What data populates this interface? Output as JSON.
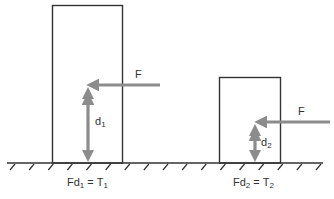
{
  "diagram": {
    "colors": {
      "outline": "#333333",
      "arrow": "#8c8c8c",
      "text": "#333333",
      "background": "#ffffff"
    },
    "ground": {
      "y": 163,
      "x_start": 7,
      "x_end": 323,
      "hatch_count": 17
    },
    "objects": [
      {
        "id": "tall-block",
        "box": {
          "x": 52,
          "y": 5,
          "w": 71,
          "h": 158
        },
        "force": {
          "label": "F",
          "from_x": 160,
          "to_x": 87,
          "y": 85
        },
        "moment_arm": {
          "label": "d",
          "subscript": "1",
          "x": 88,
          "y_top": 87,
          "y_bottom": 162
        },
        "equation": {
          "lhs_main": "Fd",
          "lhs_sub": "1",
          "eq": " = ",
          "rhs_main": "T",
          "rhs_sub": "1"
        }
      },
      {
        "id": "short-block",
        "box": {
          "x": 219,
          "y": 77,
          "w": 62,
          "h": 86
        },
        "force": {
          "label": "F",
          "from_x": 330,
          "to_x": 254,
          "y": 122
        },
        "moment_arm": {
          "label": "d",
          "subscript": "2",
          "x": 255,
          "y_top": 124,
          "y_bottom": 162
        },
        "equation": {
          "lhs_main": "Fd",
          "lhs_sub": "2",
          "eq": " = ",
          "rhs_main": "T",
          "rhs_sub": "2"
        }
      }
    ]
  }
}
